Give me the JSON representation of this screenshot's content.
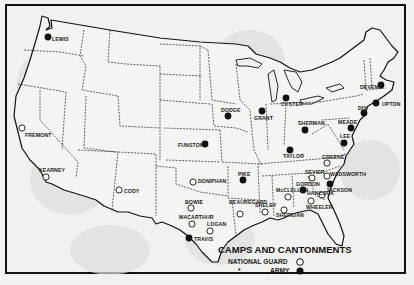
{
  "map": {
    "title": "CAMPS AND CANTONMENTS",
    "legend": [
      {
        "label": "NATIONAL GUARD",
        "symbol": "open-circle"
      },
      {
        "label": "ARMY",
        "symbol": "filled-circle"
      }
    ],
    "legend_mark": "*",
    "colors": {
      "background": "#f1f1ef",
      "ink": "#111111",
      "land_shade": "#dcdcda"
    },
    "camps": [
      {
        "name": "LEWIS",
        "type": "army",
        "x": 48,
        "y": 37,
        "lx": 52,
        "ly": 41
      },
      {
        "name": "FREMONT",
        "type": "guard",
        "x": 22,
        "y": 128,
        "lx": 25,
        "ly": 137
      },
      {
        "name": "KEARNEY",
        "type": "guard",
        "x": 46,
        "y": 177,
        "lx": 39,
        "ly": 172
      },
      {
        "name": "CODY",
        "type": "guard",
        "x": 119,
        "y": 190,
        "lx": 124,
        "ly": 193
      },
      {
        "name": "FUNSTON",
        "type": "army",
        "x": 205,
        "y": 144,
        "lx": 178,
        "ly": 147
      },
      {
        "name": "DONIPHAN",
        "type": "guard",
        "x": 193,
        "y": 182,
        "lx": 198,
        "ly": 183
      },
      {
        "name": "BOWIE",
        "type": "guard",
        "x": 191,
        "y": 208,
        "lx": 185,
        "ly": 204
      },
      {
        "name": "MACARTHUR",
        "type": "guard",
        "x": 192,
        "y": 224,
        "lx": 179,
        "ly": 219
      },
      {
        "name": "LOGAN",
        "type": "guard",
        "x": 210,
        "y": 231,
        "lx": 207,
        "ly": 226
      },
      {
        "name": "TRAVIS",
        "type": "army",
        "x": 189,
        "y": 238,
        "lx": 194,
        "ly": 241
      },
      {
        "name": "PIKE",
        "type": "army",
        "x": 243,
        "y": 180,
        "lx": 238,
        "ly": 176
      },
      {
        "name": "BEAUREGARD",
        "type": "guard",
        "x": 240,
        "y": 214,
        "lx": 229,
        "ly": 204
      },
      {
        "name": "SHELBY",
        "type": "guard",
        "x": 265,
        "y": 212,
        "lx": 255,
        "ly": 207
      },
      {
        "name": "DODGE",
        "type": "army",
        "x": 228,
        "y": 116,
        "lx": 221,
        "ly": 112
      },
      {
        "name": "GRANT",
        "type": "army",
        "x": 262,
        "y": 111,
        "lx": 254,
        "ly": 120
      },
      {
        "name": "CUSTER",
        "type": "army",
        "x": 286,
        "y": 98,
        "lx": 281,
        "ly": 106
      },
      {
        "name": "SHERMAN",
        "type": "army",
        "x": 305,
        "y": 130,
        "lx": 298,
        "ly": 125
      },
      {
        "name": "TAYLOR",
        "type": "army",
        "x": 290,
        "y": 150,
        "lx": 283,
        "ly": 158
      },
      {
        "name": "LEE",
        "type": "army",
        "x": 344,
        "y": 143,
        "lx": 340,
        "ly": 138
      },
      {
        "name": "GREENE",
        "type": "guard",
        "x": 327,
        "y": 163,
        "lx": 322,
        "ly": 159
      },
      {
        "name": "SEVIER",
        "type": "guard",
        "x": 312,
        "y": 178,
        "lx": 305,
        "ly": 174
      },
      {
        "name": "WADSWORTH",
        "type": "guard",
        "x": 327,
        "y": 176,
        "lx": 330,
        "ly": 176
      },
      {
        "name": "GORDON",
        "type": "army",
        "x": 303,
        "y": 190,
        "lx": 296,
        "ly": 186
      },
      {
        "name": "JACKSON",
        "type": "army",
        "x": 330,
        "y": 184,
        "lx": 326,
        "ly": 192
      },
      {
        "name": "McCLELLAN",
        "type": "guard",
        "x": 288,
        "y": 197,
        "lx": 276,
        "ly": 192
      },
      {
        "name": "HANCOCK",
        "type": "guard",
        "x": 322,
        "y": 195,
        "lx": 307,
        "ly": 195
      },
      {
        "name": "SHERIDAN",
        "type": "guard",
        "x": 284,
        "y": 210,
        "lx": 276,
        "ly": 217
      },
      {
        "name": "WHEELER",
        "type": "guard",
        "x": 311,
        "y": 201,
        "lx": 306,
        "ly": 209
      },
      {
        "name": "MEADE",
        "type": "army",
        "x": 351,
        "y": 128,
        "lx": 338,
        "ly": 124
      },
      {
        "name": "DIX",
        "type": "army",
        "x": 364,
        "y": 113,
        "lx": 358,
        "ly": 110
      },
      {
        "name": "UPTON",
        "type": "army",
        "x": 376,
        "y": 103,
        "lx": 382,
        "ly": 106
      },
      {
        "name": "DEVENS",
        "type": "army",
        "x": 381,
        "y": 85,
        "lx": 360,
        "ly": 89
      }
    ]
  }
}
